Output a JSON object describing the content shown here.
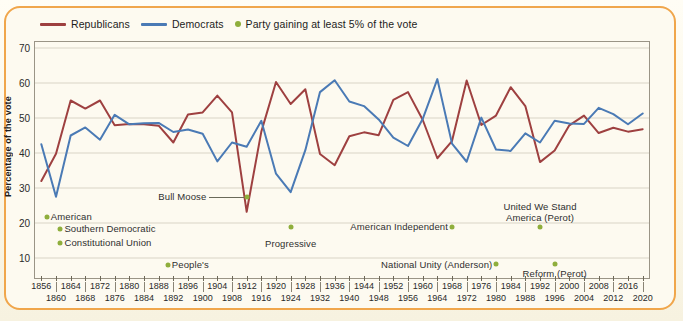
{
  "legend": {
    "republicans": "Republicans",
    "democrats": "Democrats",
    "third_party": "Party gaining at least 5% of the vote",
    "republican_color": "#9e4040",
    "democrat_color": "#4a7ab5",
    "third_party_color": "#8fae3c"
  },
  "axes": {
    "ylabel": "Percentage of the vote",
    "yticks": [
      10,
      20,
      30,
      40,
      50,
      60,
      70
    ],
    "ylim": [
      4,
      72
    ],
    "xlim": [
      1854,
      2022
    ]
  },
  "annotations": [
    {
      "name": "american",
      "label": "American",
      "dot_x": 1857.5,
      "dot_y": 21.8,
      "text_x": 1858.6,
      "text_y": 21.8,
      "align": "left"
    },
    {
      "name": "southern-democratic",
      "label": "Southern Democratic",
      "dot_x": 1861.2,
      "dot_y": 18.3,
      "text_x": 1862.3,
      "text_y": 18.3,
      "align": "left"
    },
    {
      "name": "constitutional-union",
      "label": "Constitutional Union",
      "dot_x": 1861.2,
      "dot_y": 14.4,
      "text_x": 1862.3,
      "text_y": 14.4,
      "align": "left"
    },
    {
      "name": "peoples",
      "label": "People's",
      "dot_x": 1890.5,
      "dot_y": 8.0,
      "text_x": 1891.6,
      "text_y": 8.0,
      "align": "left"
    },
    {
      "name": "bull-moose",
      "label": "Bull Moose",
      "dot_x": 1912.0,
      "dot_y": 27.4,
      "text_x": 1901.0,
      "text_y": 27.4,
      "align": "right",
      "leader": true
    },
    {
      "name": "progressive",
      "label": "Progressive",
      "dot_x": 1924.0,
      "dot_y": 18.8,
      "text_x": 1924.0,
      "text_y": 14.0,
      "align": "center"
    },
    {
      "name": "american-independent",
      "label": "American Independent",
      "dot_x": 1968.0,
      "dot_y": 18.8,
      "text_x": 1966.9,
      "text_y": 18.8,
      "align": "right"
    },
    {
      "name": "national-unity-anderson",
      "label": "National Unity (Anderson)",
      "dot_x": 1980.0,
      "dot_y": 8.4,
      "text_x": 1979.0,
      "text_y": 8.0,
      "align": "right"
    },
    {
      "name": "united-we-stand-america-perot",
      "label": "United We Stand\nAmerica (Perot)",
      "dot_x": 1992.0,
      "dot_y": 18.8,
      "text_x": 1992.0,
      "text_y": 24.5,
      "align": "center"
    },
    {
      "name": "reform-perot",
      "label": "Reform (Perot)",
      "dot_x": 1996.0,
      "dot_y": 8.4,
      "text_x": 1996.0,
      "text_y": 5.4,
      "align": "center"
    }
  ],
  "chart_data": {
    "type": "line",
    "title": "",
    "xlabel": "",
    "ylabel": "Percentage of the vote",
    "ylim": [
      4,
      72
    ],
    "grid": true,
    "legend_position": "top-left",
    "x": [
      1856,
      1860,
      1864,
      1868,
      1872,
      1876,
      1880,
      1884,
      1888,
      1892,
      1896,
      1900,
      1904,
      1908,
      1912,
      1916,
      1920,
      1924,
      1928,
      1932,
      1936,
      1940,
      1944,
      1948,
      1952,
      1956,
      1960,
      1964,
      1968,
      1972,
      1976,
      1980,
      1984,
      1988,
      1992,
      1996,
      2000,
      2004,
      2008,
      2012,
      2016,
      2020
    ],
    "series": [
      {
        "name": "Republicans",
        "color": "#9e4040",
        "values": [
          32.0,
          39.8,
          55.0,
          52.7,
          55.0,
          47.9,
          48.3,
          48.2,
          47.8,
          43.0,
          51.0,
          51.6,
          56.4,
          51.6,
          23.2,
          46.1,
          60.3,
          54.0,
          58.2,
          39.7,
          36.5,
          44.8,
          45.9,
          45.1,
          55.2,
          57.4,
          49.5,
          38.5,
          43.4,
          60.7,
          48.0,
          50.7,
          58.8,
          53.4,
          37.4,
          40.7,
          47.9,
          50.7,
          45.7,
          47.2,
          46.1,
          46.8
        ]
      },
      {
        "name": "Democrats",
        "color": "#4a7ab5",
        "values": [
          42.5,
          27.5,
          45.0,
          47.3,
          43.8,
          50.9,
          48.2,
          48.5,
          48.6,
          46.0,
          46.7,
          45.5,
          37.6,
          43.0,
          41.8,
          49.2,
          34.1,
          28.8,
          40.8,
          57.4,
          60.8,
          54.7,
          53.4,
          49.6,
          44.4,
          42.0,
          49.7,
          61.1,
          42.7,
          37.5,
          50.1,
          41.0,
          40.6,
          45.6,
          43.0,
          49.2,
          48.4,
          48.3,
          52.9,
          51.1,
          48.2,
          51.3
        ]
      }
    ],
    "third_party_points": [
      {
        "label": "American",
        "year": 1856,
        "value": 21.5
      },
      {
        "label": "Southern Democratic",
        "year": 1860,
        "value": 18.1
      },
      {
        "label": "Constitutional Union",
        "year": 1860,
        "value": 12.6
      },
      {
        "label": "People's",
        "year": 1892,
        "value": 8.5
      },
      {
        "label": "Bull Moose",
        "year": 1912,
        "value": 27.4
      },
      {
        "label": "Progressive",
        "year": 1924,
        "value": 16.6
      },
      {
        "label": "American Independent",
        "year": 1968,
        "value": 13.5
      },
      {
        "label": "National Unity (Anderson)",
        "year": 1980,
        "value": 6.6
      },
      {
        "label": "United We Stand America (Perot)",
        "year": 1992,
        "value": 18.9
      },
      {
        "label": "Reform (Perot)",
        "year": 1996,
        "value": 8.4
      }
    ]
  },
  "x_axis_labels": {
    "top_row": [
      1856,
      1864,
      1872,
      1880,
      1888,
      1896,
      1904,
      1912,
      1920,
      1928,
      1936,
      1944,
      1952,
      1960,
      1968,
      1976,
      1984,
      1992,
      2000,
      2008,
      2016
    ],
    "bottom_row": [
      1860,
      1868,
      1876,
      1884,
      1892,
      1900,
      1908,
      1916,
      1924,
      1932,
      1940,
      1948,
      1956,
      1964,
      1972,
      1980,
      1988,
      1996,
      2004,
      2012,
      2020
    ]
  }
}
